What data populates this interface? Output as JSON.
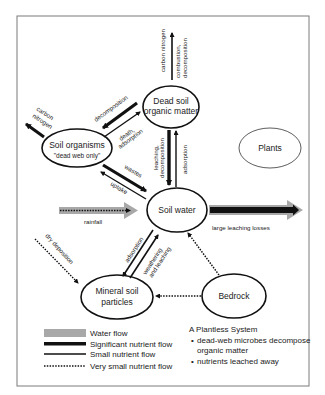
{
  "diagram": {
    "title": "A Plantless System",
    "notes": [
      "dead-web microbes decompose organic matter",
      "nutrients leached away"
    ],
    "nodes": {
      "dead_soil": {
        "line1": "Dead soil",
        "line2": "organic matter"
      },
      "soil_organisms": {
        "line1": "Soil organisms",
        "line2": "\"dead web only\""
      },
      "plants": {
        "line1": "Plants"
      },
      "soil_water": {
        "line1": "Soil water"
      },
      "mineral_soil": {
        "line1": "Mineral soil",
        "line2": "particles"
      },
      "bedrock": {
        "line1": "Bedrock"
      }
    },
    "flows": {
      "carbon_nitrogen_up": "carbon nitrogen",
      "combustion_1": "combustion,",
      "combustion_2": "decomposition",
      "carbon_left_1": "carbon",
      "carbon_left_2": "nitrogen",
      "decomposition": "decomposition",
      "death_1": "death,",
      "death_2": "adsorption",
      "leaching_1": "leaching,",
      "leaching_2": "decomposition",
      "adsorption_up": "adsorption",
      "wastes": "wastes",
      "uptake": "uptake",
      "rainfall": "rainfall",
      "large_leaching": "large leaching losses",
      "dry_deposition": "dry deposition",
      "adsorption_down": "adsorption",
      "weathering_1": "weathering",
      "weathering_2": "and leaching"
    },
    "legend": [
      {
        "label": "Water flow",
        "style": "water"
      },
      {
        "label": "Significant nutrient flow",
        "style": "significant"
      },
      {
        "label": "Small nutrient flow",
        "style": "small"
      },
      {
        "label": "Very small nutrient flow",
        "style": "very-small"
      }
    ],
    "colors": {
      "water_flow": "#a8a8a8",
      "nutrient_flow": "#111111",
      "frame": "#7a7a7a"
    }
  }
}
